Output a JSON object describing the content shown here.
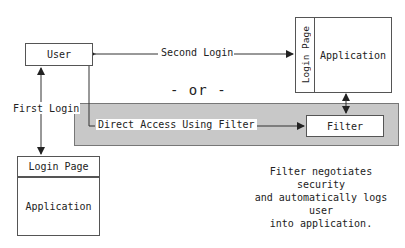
{
  "diagram": {
    "user_box": {
      "label": "User"
    },
    "second_login": {
      "label": "Second Login"
    },
    "first_login": {
      "label": "First Login"
    },
    "or_separator": {
      "label": "- or -"
    },
    "direct_access": {
      "label": "Direct Access Using Filter"
    },
    "filter_box": {
      "label": "Filter"
    },
    "right_app": {
      "login_page_label": "Login Page",
      "application_label": "Application"
    },
    "bottom_app": {
      "login_page_label": "Login Page",
      "application_label": "Application"
    },
    "note": {
      "lines": [
        "Filter negotiates security",
        "and automatically logs user",
        "into application."
      ]
    },
    "colors": {
      "band": "#c8c8c8",
      "stroke": "#555555",
      "text": "#222222"
    }
  }
}
